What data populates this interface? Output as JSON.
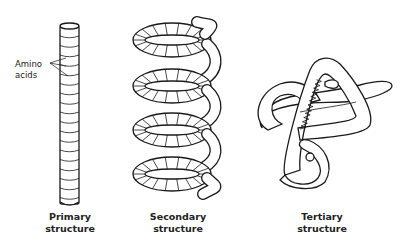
{
  "diagram": {
    "panels": [
      {
        "id": "primary",
        "caption_line1": "Primary",
        "caption_line2": "structure",
        "depiction": "straight cylinder of stacked segments",
        "annotation": {
          "line1": "Amino",
          "line2": "acids",
          "pointer_count": 3
        }
      },
      {
        "id": "secondary",
        "caption_line1": "Secondary",
        "caption_line2": "structure",
        "depiction": "coiled helix (4 turns) of segmented tube"
      },
      {
        "id": "tertiary",
        "caption_line1": "Tertiary",
        "caption_line2": "structure",
        "depiction": "folded tube with embedded helix"
      }
    ],
    "colors": {
      "line": "#1a1a1a",
      "background": "#ffffff",
      "text": "#222222"
    }
  }
}
